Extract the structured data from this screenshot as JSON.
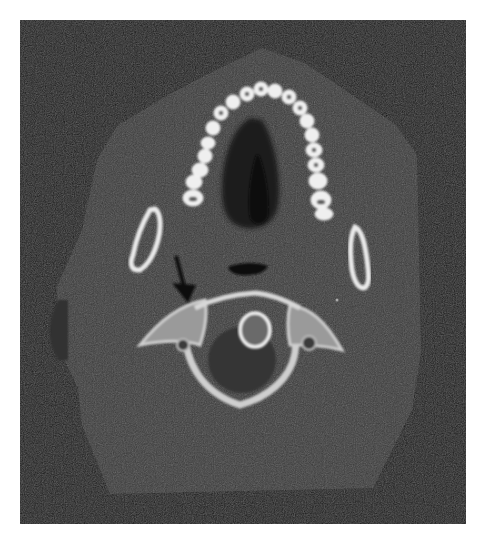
{
  "figure": {
    "modality": "CT",
    "view": "axial",
    "colors": {
      "background_frame": "#1b1b1b",
      "soft_tissue": "#3b3b3b",
      "bone": "#eeeeee",
      "airway": "#151515",
      "page": "#ffffff",
      "arrow": "#0e0e0e"
    },
    "annotations": [
      {
        "type": "arrow",
        "label": "arrow-indicating-finding",
        "points_to": "right side of vertebra (image left)"
      }
    ],
    "structures": [
      "soft-tissue-outline",
      "dental-arch",
      "palate-airway",
      "mandibular-ramus-left",
      "mandibular-ramus-right",
      "pharyngeal-airway",
      "cervical-vertebra",
      "dens",
      "spinal-canal"
    ]
  }
}
